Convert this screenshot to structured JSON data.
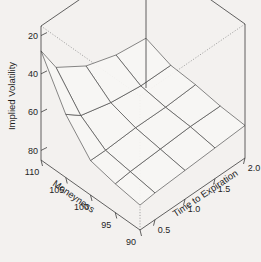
{
  "figure": {
    "background_color": "#f3f1ef",
    "line_color": "#3b3b3b",
    "surface_fill": "#f7f6f4"
  },
  "chart_data": {
    "type": "surface",
    "title": "",
    "xlabel": "Moneyness",
    "ylabel": "Time to Expiration",
    "zlabel": "Implied Volatility",
    "grid": false,
    "legend": "none",
    "projection": "3d-wireframe-surface",
    "x": [
      90,
      95,
      100,
      105,
      110
    ],
    "y": [
      0.25,
      0.5,
      1.0,
      1.5,
      2.0
    ],
    "xlim": [
      90,
      110
    ],
    "ylim": [
      0.25,
      2.0
    ],
    "zlim": [
      15,
      85
    ],
    "xticks": [
      110,
      105,
      100,
      95,
      90
    ],
    "yticks": [
      0.5,
      1.0,
      1.5,
      2.0
    ],
    "zticks": [
      20,
      40,
      60,
      80
    ],
    "z_matrix_note": "rows indexed by x (moneyness 90..110), columns by y (time 0.25..2.0)",
    "z": [
      [
        28,
        29,
        30,
        31,
        32
      ],
      [
        30,
        31,
        32,
        33,
        33
      ],
      [
        33,
        33,
        34,
        34,
        35
      ],
      [
        48,
        42,
        38,
        36,
        36
      ],
      [
        72,
        58,
        48,
        43,
        41
      ]
    ]
  },
  "axes": {
    "z_axis": {
      "name": "Implied Volatility",
      "ticks": [
        "80",
        "60",
        "40",
        "20"
      ]
    },
    "x_axis": {
      "name": "Moneyness",
      "ticks": [
        "110",
        "105",
        "100",
        "95",
        "90"
      ]
    },
    "y_axis": {
      "name": "Time to Expiration",
      "ticks": [
        "0.5",
        "1.0",
        "1.5",
        "2.0"
      ]
    }
  }
}
